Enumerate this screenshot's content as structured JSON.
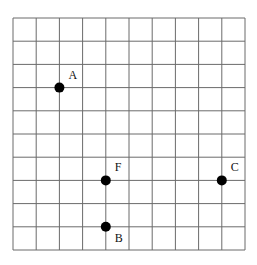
{
  "diagram": {
    "type": "grid-with-points",
    "grid": {
      "columns": 10,
      "rows": 10,
      "origin_px": [
        13,
        18
      ],
      "cell_px": 23.2,
      "line_color": "#6b6b6b"
    },
    "points": [
      {
        "label": "A",
        "col": 2,
        "row": 3,
        "label_offset": [
          9,
          -9
        ]
      },
      {
        "label": "F",
        "col": 4,
        "row": 7,
        "label_offset": [
          9,
          -9
        ]
      },
      {
        "label": "B",
        "col": 4,
        "row": 9,
        "label_offset": [
          9,
          15
        ]
      },
      {
        "label": "C",
        "col": 9,
        "row": 7,
        "label_offset": [
          9,
          -9
        ]
      }
    ],
    "point_color": "#000000",
    "point_radius": 5
  }
}
